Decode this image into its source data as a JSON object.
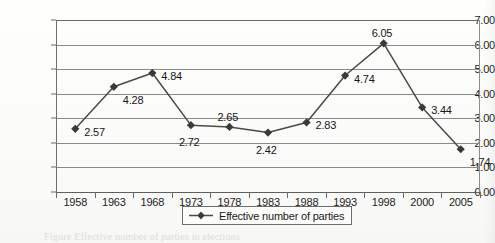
{
  "chart_data": {
    "type": "line",
    "title": "",
    "subtitle": "",
    "xlabel": "",
    "ylabel": "",
    "categories": [
      "1958",
      "1963",
      "1968",
      "1973",
      "1978",
      "1983",
      "1988",
      "1993",
      "1998",
      "2000",
      "2005"
    ],
    "values": [
      2.57,
      4.28,
      4.84,
      2.72,
      2.65,
      2.42,
      2.83,
      4.74,
      6.05,
      3.44,
      1.74
    ],
    "point_labels": [
      "2.57",
      "4.28",
      "4.84",
      "2.72",
      "2.65",
      "2.42",
      "2.83",
      "4.74",
      "6.05",
      "3.44",
      "1.74"
    ],
    "label_positions": [
      "right",
      "below-right",
      "right",
      "below",
      "above",
      "below",
      "right",
      "right",
      "above",
      "right",
      "below-right"
    ],
    "series": [
      {
        "name": "Effective number of parties",
        "values": [
          2.57,
          4.28,
          4.84,
          2.72,
          2.65,
          2.42,
          2.83,
          4.74,
          6.05,
          3.44,
          1.74
        ]
      }
    ],
    "ylim": [
      0,
      7
    ],
    "ytick_step": 1,
    "ytick_labels": [
      "0.00",
      "1.00",
      "2.00",
      "3.00",
      "4.00",
      "5.00",
      "6.00",
      "7.00"
    ],
    "grid": true,
    "grid_axis": "y",
    "legend_position": "bottom",
    "marker": "diamond",
    "line_color": "#4a4a4a",
    "marker_color": "#3a3a3a",
    "grid_color": "#8a8a8a",
    "axis_color": "#6b6b6b",
    "background_color": "#fdfdfb"
  },
  "legend": {
    "entries": [
      {
        "label": "Effective number of parties",
        "marker": "diamond",
        "color": "#3a3a3a"
      }
    ]
  },
  "caption": {
    "text": "Figure   Effective number of parties  in  elections"
  }
}
